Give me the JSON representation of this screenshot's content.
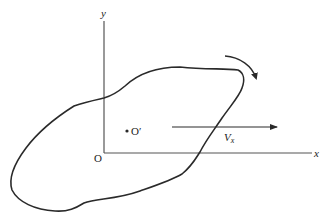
{
  "diagram": {
    "type": "rigid body in plane translation and rotation",
    "colors": {
      "stroke": "#2a2a2a",
      "axis": "#555555",
      "background": "#ffffff"
    },
    "axes": {
      "x_label": "x",
      "y_label": "y",
      "origin_label": "O"
    },
    "body": {
      "center_label": "O′",
      "velocity_label_main": "V",
      "velocity_label_sub": "x",
      "rotation": "clockwise"
    }
  }
}
